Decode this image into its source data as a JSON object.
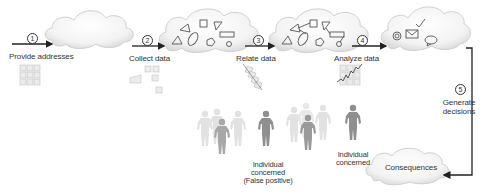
{
  "diagram": {
    "steps": [
      {
        "number": "1",
        "label": "Provide addresses"
      },
      {
        "number": "2",
        "label": "Collect data"
      },
      {
        "number": "3",
        "label": "Relate data"
      },
      {
        "number": "4",
        "label": "Analyze data"
      },
      {
        "number": "5",
        "label_line1": "Generate",
        "label_line2": "decisions"
      }
    ],
    "clouds": [
      {
        "name": "empty-cloud"
      },
      {
        "name": "collected-data-cloud"
      },
      {
        "name": "related-data-cloud"
      },
      {
        "name": "communications-cloud"
      },
      {
        "name": "consequences-cloud",
        "label": "Consequences"
      }
    ],
    "people": {
      "false_positive": {
        "line1": "Individual",
        "line2": "concerned",
        "line3": "(False positive)"
      },
      "true_target": {
        "line1": "Individual",
        "line2": "concerned"
      }
    },
    "colors": {
      "arrow": "#222222",
      "cloud_fill": "#f2f2f2",
      "cloud_stroke": "#cfcfcf",
      "person_light": "#dcdcdc",
      "person_dark": "#8c8c8c"
    }
  }
}
